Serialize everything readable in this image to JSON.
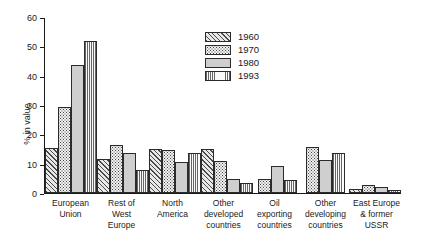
{
  "chart_data": {
    "type": "bar",
    "title": "",
    "xlabel": "",
    "ylabel": "% in value",
    "ylim": [
      0,
      60
    ],
    "yticks": [
      0,
      10,
      20,
      30,
      40,
      50,
      60
    ],
    "grid": false,
    "legend_position": "upper-center",
    "categories": [
      "European\nUnion",
      "Rest of\nWest\nEurope",
      "North\nAmerica",
      "Other\ndeveloped\ncountries",
      "Oil\nexporting\ncountries",
      "Other\ndeveloping\ncountries",
      "East Europe\n& former\nUSSR"
    ],
    "series": [
      {
        "name": "1960",
        "pattern": "diagonal-hatch",
        "values": [
          15.4,
          11.6,
          15.1,
          15.0,
          null,
          null,
          1.3
        ]
      },
      {
        "name": "1970",
        "pattern": "coarse-stipple",
        "values": [
          29.4,
          16.5,
          14.8,
          11.0,
          4.9,
          15.6,
          2.6
        ]
      },
      {
        "name": "1980",
        "pattern": "solid-grey",
        "values": [
          43.6,
          13.8,
          10.7,
          4.8,
          9.3,
          11.2,
          1.9
        ]
      },
      {
        "name": "1993",
        "pattern": "fine-vertical-lines",
        "values": [
          51.8,
          7.9,
          13.5,
          3.3,
          4.5,
          13.7,
          1.0
        ]
      }
    ]
  }
}
